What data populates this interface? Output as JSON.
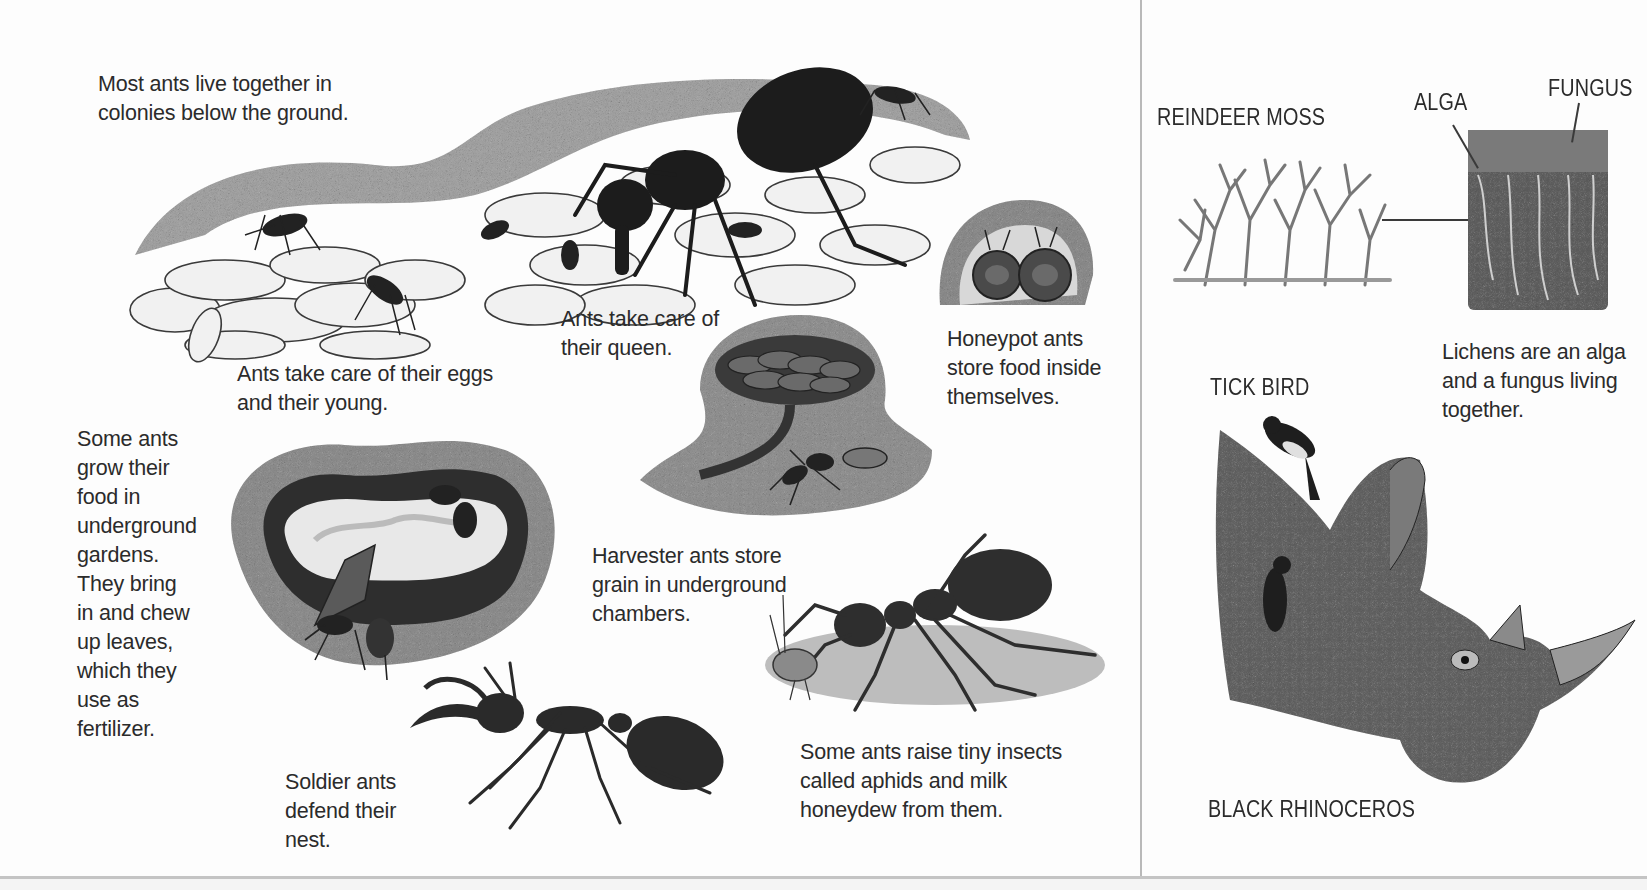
{
  "left_page": {
    "topic": "ant colonies",
    "captions": {
      "colonies": "Most ants live together in\ncolonies below the ground.",
      "eggs": "Ants take care of their eggs\nand their young.",
      "queen": "Ants take care of\ntheir queen.",
      "honeypot": "Honeypot ants\nstore food inside\nthemselves.",
      "gardens": "Some ants\ngrow their\nfood in\nunderground\ngardens.\nThey bring\nin and chew\nup leaves,\nwhich they\nuse as\nfertilizer.",
      "harvester": "Harvester ants store\ngrain in underground\nchambers.",
      "soldier": "Soldier ants\ndefend their\nnest.",
      "aphids": "Some ants raise tiny insects\ncalled aphids and milk\nhoneydew from them."
    },
    "illustrations": [
      {
        "name": "ant-colony-nest-illustration"
      },
      {
        "name": "honeypot-ants-illustration"
      },
      {
        "name": "harvester-chamber-illustration"
      },
      {
        "name": "fungus-garden-illustration"
      },
      {
        "name": "soldier-ant-illustration"
      },
      {
        "name": "ant-milking-aphid-illustration"
      }
    ]
  },
  "right_page": {
    "labels": {
      "reindeer_moss": "REINDEER MOSS",
      "alga": "ALGA",
      "fungus": "FUNGUS",
      "tick_bird": "TICK BIRD",
      "black_rhino": "BLACK RHINOCEROS"
    },
    "captions": {
      "lichens": "Lichens are an alga\nand a fungus living\ntogether."
    },
    "illustrations": [
      {
        "name": "reindeer-moss-illustration"
      },
      {
        "name": "lichen-cross-section-illustration"
      },
      {
        "name": "black-rhinoceros-with-tick-birds-illustration"
      }
    ]
  },
  "colors": {
    "paper": "#fdfdfd",
    "ink": "#2b2b2b",
    "gutter": "#b9b9b9"
  }
}
